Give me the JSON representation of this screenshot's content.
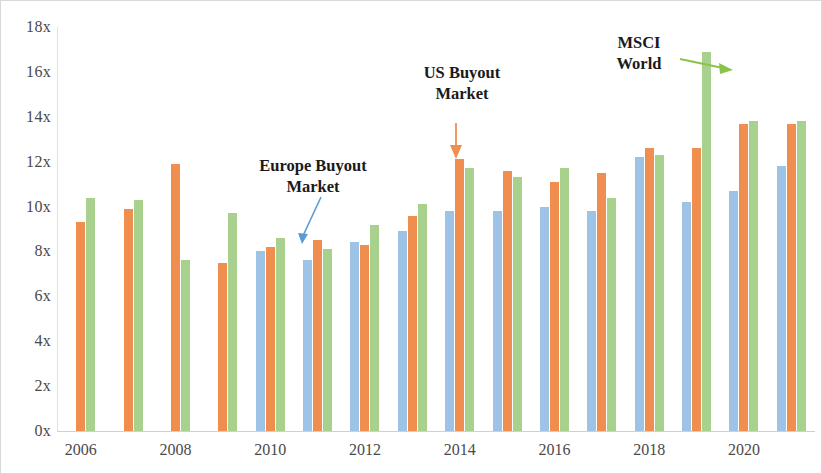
{
  "chart_data": {
    "type": "bar",
    "title": "",
    "subtitle": "",
    "xlabel": "",
    "ylabel": "",
    "ylim": [
      0,
      18
    ],
    "ytick_values": [
      0,
      2,
      4,
      6,
      8,
      10,
      12,
      14,
      16,
      18
    ],
    "ytick_labels": [
      "0x",
      "2x",
      "4x",
      "6x",
      "8x",
      "10x",
      "12x",
      "14x",
      "16x",
      "18x"
    ],
    "grid": false,
    "legend": "annotations",
    "categories": [
      2006,
      2007,
      2008,
      2009,
      2010,
      2011,
      2012,
      2013,
      2014,
      2015,
      2016,
      2017,
      2018,
      2019,
      2020,
      2021
    ],
    "xtick_labels": [
      "2006",
      "2008",
      "2010",
      "2012",
      "2014",
      "2016",
      "2018",
      "2020"
    ],
    "xtick_categories": [
      2006,
      2008,
      2010,
      2012,
      2014,
      2016,
      2018,
      2020
    ],
    "series": [
      {
        "name": "Europe Buyout Market",
        "color": "#9dc3e6",
        "values": [
          null,
          null,
          null,
          null,
          8.0,
          7.6,
          8.4,
          8.9,
          9.8,
          9.8,
          10.0,
          9.8,
          12.2,
          10.2,
          10.7,
          11.8
        ]
      },
      {
        "name": "US Buyout Market",
        "color": "#ef8e4e",
        "values": [
          9.3,
          9.9,
          11.9,
          7.5,
          8.2,
          8.5,
          8.3,
          9.6,
          12.1,
          11.6,
          11.1,
          11.5,
          12.6,
          12.6,
          13.7,
          13.7
        ]
      },
      {
        "name": "MSCI World",
        "color": "#a9d18e",
        "values": [
          10.4,
          10.3,
          7.6,
          9.7,
          8.6,
          8.1,
          9.2,
          10.1,
          11.7,
          11.3,
          11.7,
          10.4,
          12.3,
          16.9,
          13.8,
          13.8
        ]
      }
    ],
    "annotations": [
      {
        "id": "europe",
        "text": "Europe Buyout\nMarket",
        "color": "#5b9bd5",
        "arrow": "down-left"
      },
      {
        "id": "us",
        "text": "US Buyout\nMarket",
        "color": "#ef8e4e",
        "arrow": "down"
      },
      {
        "id": "msci",
        "text": "MSCI\nWorld",
        "color": "#8bc34a",
        "arrow": "right"
      }
    ]
  },
  "colors": {
    "europe": "#9dc3e6",
    "us": "#ef8e4e",
    "msci": "#a9d18e",
    "axis_text": "#4a4a4a",
    "border": "#d9d9d9",
    "background": "#ffffff"
  }
}
